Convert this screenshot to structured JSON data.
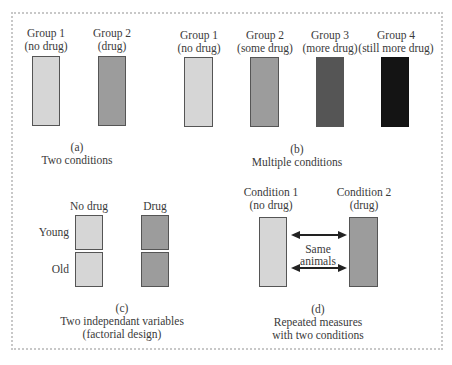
{
  "panels": {
    "a": {
      "groups": [
        {
          "name": "Group 1",
          "condition": "(no drug)",
          "shade": "light"
        },
        {
          "name": "Group 2",
          "condition": "(drug)",
          "shade": "medium"
        }
      ],
      "letter": "(a)",
      "caption": "Two conditions"
    },
    "b": {
      "groups": [
        {
          "name": "Group 1",
          "condition": "(no drug)",
          "shade": "light"
        },
        {
          "name": "Group 2",
          "condition": "(some drug)",
          "shade": "medium"
        },
        {
          "name": "Group 3",
          "condition": "(more drug)",
          "shade": "dark"
        },
        {
          "name": "Group 4",
          "condition": "(still more drug)",
          "shade": "black"
        }
      ],
      "letter": "(b)",
      "caption": "Multiple conditions"
    },
    "c": {
      "columns": [
        "No drug",
        "Drug"
      ],
      "rows": [
        "Young",
        "Old"
      ],
      "letter": "(c)",
      "caption_line1": "Two independant variables",
      "caption_line2": "(factorial design)"
    },
    "d": {
      "conditions": [
        {
          "name": "Condition 1",
          "condition": "(no drug)",
          "shade": "light"
        },
        {
          "name": "Condition  2",
          "condition": "(drug)",
          "shade": "medium"
        }
      ],
      "arrow_label_line1": "Same",
      "arrow_label_line2": "animals",
      "letter": "(d)",
      "caption_line1": "Repeated measures",
      "caption_line2": "with two conditions"
    }
  },
  "colors": {
    "light": "#d6d6d6",
    "medium": "#9c9c9c",
    "dark": "#555555",
    "black": "#141414",
    "frame": "#c8c8c8"
  }
}
